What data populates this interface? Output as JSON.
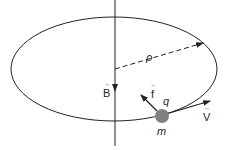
{
  "diagram": {
    "labels": {
      "radius": "ρ",
      "field": "B",
      "force": "f",
      "charge": "q",
      "velocity": "V",
      "mass": "m",
      "vector_mark": "→"
    },
    "colors": {
      "line": "#222222",
      "particle": "#808080",
      "background": "#ffffff"
    }
  }
}
